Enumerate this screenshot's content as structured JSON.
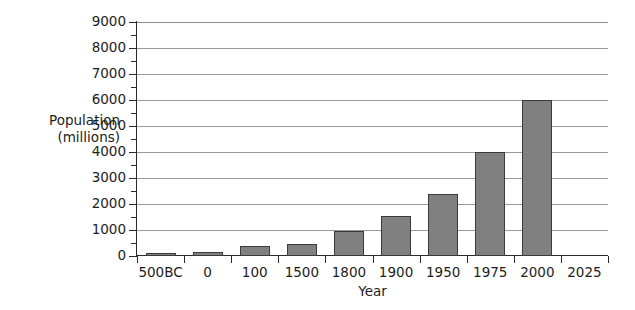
{
  "chart_data": {
    "type": "bar",
    "title": "",
    "xlabel": "Year",
    "ylabel_line1": "Population",
    "ylabel_line2": "(millions)",
    "ylabel": "Population (millions)",
    "categories": [
      "500BC",
      "0",
      "100",
      "1500",
      "1800",
      "1900",
      "1950",
      "1975",
      "2000",
      "2025"
    ],
    "values": [
      100,
      170,
      400,
      470,
      980,
      1550,
      2400,
      4000,
      6000,
      null
    ],
    "ylim": [
      0,
      9000
    ],
    "ytick_labels": [
      "0",
      "1000",
      "2000",
      "3000",
      "4000",
      "5000",
      "6000",
      "7000",
      "8000",
      "9000"
    ],
    "ytick_values": [
      0,
      1000,
      2000,
      3000,
      4000,
      5000,
      6000,
      7000,
      8000,
      9000
    ],
    "yminor_step": 500,
    "grid": "horizontal",
    "legend": "none",
    "bar_color": "#808080",
    "bar_edge_color": "#3b3b3b",
    "axis_color": "#2b2b2b",
    "grid_color": "#9a9a9a",
    "background": "#ffffff"
  }
}
